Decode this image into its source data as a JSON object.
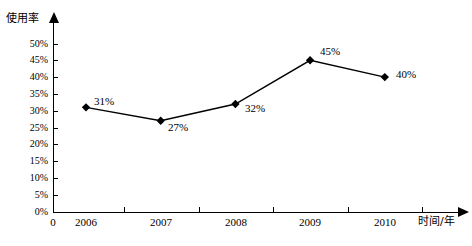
{
  "chart_data": {
    "type": "line",
    "title": "",
    "xlabel": "时间/年",
    "ylabel": "使用率",
    "categories": [
      "2006",
      "2007",
      "2008",
      "2009",
      "2010"
    ],
    "values": [
      31,
      27,
      32,
      45,
      40
    ],
    "data_labels": [
      "31%",
      "27%",
      "32%",
      "45%",
      "40%"
    ],
    "ylim": [
      0,
      50
    ],
    "ytick_values": [
      0,
      5,
      10,
      15,
      20,
      25,
      30,
      35,
      40,
      45,
      50
    ],
    "ytick_labels": [
      "0%",
      "5%",
      "10%",
      "15%",
      "20%",
      "25%",
      "30%",
      "35%",
      "40%",
      "45%",
      "50%"
    ],
    "origin_label": "0",
    "grid": false,
    "legend": false,
    "series_color": "#000000",
    "marker": "diamond",
    "series": [
      {
        "name": "使用率",
        "values": [
          31,
          27,
          32,
          45,
          40
        ]
      }
    ]
  },
  "axes": {
    "y_title": "使用率",
    "x_title": "时间/年",
    "origin": "0"
  }
}
